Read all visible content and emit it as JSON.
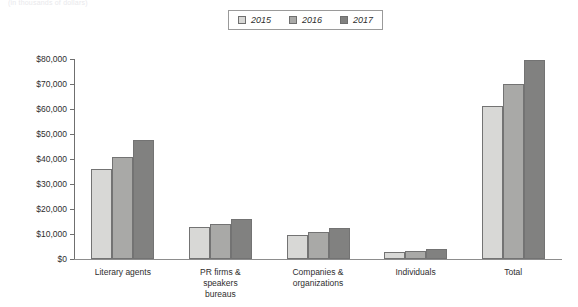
{
  "caption": "(in thousands of dollars)",
  "legend": {
    "position": "top-center",
    "items": [
      {
        "label": "2015",
        "color": "#d8d8d6"
      },
      {
        "label": "2016",
        "color": "#a9a9a7"
      },
      {
        "label": "2017",
        "color": "#818180"
      }
    ]
  },
  "axis": {
    "y_ticks": [
      "$0",
      "$10,000",
      "$20,000",
      "$30,000",
      "$40,000",
      "$50,000",
      "$60,000",
      "$70,000",
      "$80,000"
    ]
  },
  "chart_data": {
    "type": "bar",
    "title": "",
    "subtitle": "",
    "xlabel": "",
    "ylabel": "",
    "ylim": [
      0,
      80000
    ],
    "ytick_step": 10000,
    "grid": false,
    "legend_position": "top-center",
    "categories": [
      "Literary agents",
      "PR firms &\nspeakers\nbureaus",
      "Companies &\norganizations",
      "Individuals",
      "Total"
    ],
    "series": [
      {
        "name": "2015",
        "color": "#d8d8d6",
        "values": [
          36000,
          12800,
          9500,
          3000,
          61300
        ]
      },
      {
        "name": "2016",
        "color": "#a9a9a7",
        "values": [
          41000,
          14000,
          10700,
          3400,
          69900
        ]
      },
      {
        "name": "2017",
        "color": "#818180",
        "values": [
          47800,
          16200,
          12400,
          4100,
          79800
        ]
      }
    ]
  }
}
